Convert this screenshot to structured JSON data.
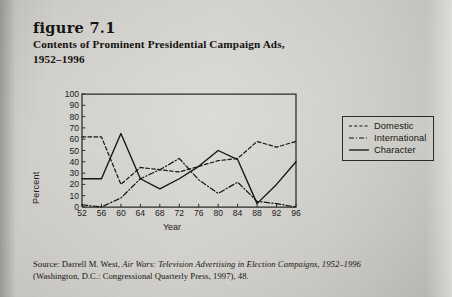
{
  "figure": {
    "number_label": "figure 7.1",
    "title_line1": "Contents of Prominent Presidential Campaign Ads,",
    "title_line2": "1952–1996"
  },
  "legend": {
    "position": "right",
    "items": [
      {
        "label": "Domestic",
        "style": "dashed"
      },
      {
        "label": "International",
        "style": "dash-dot"
      },
      {
        "label": "Character",
        "style": "solid"
      }
    ]
  },
  "source": {
    "line1_prefix": "Source: Darrell M. West, ",
    "line1_italic": "Air Wars: Television Advertising in Election Campaigns, 1952–1996",
    "line2": "(Washington, D.C.: Congressional Quarterly Press, 1997), 48."
  },
  "chart_data": {
    "type": "line",
    "title": "Contents of Prominent Presidential Campaign Ads, 1952–1996",
    "xlabel": "Year",
    "ylabel": "Percent",
    "categories": [
      "52",
      "56",
      "60",
      "64",
      "68",
      "72",
      "76",
      "80",
      "84",
      "88",
      "92",
      "96"
    ],
    "x": [
      52,
      56,
      60,
      64,
      68,
      72,
      76,
      80,
      84,
      88,
      92,
      96
    ],
    "ylim": [
      0,
      100
    ],
    "yticks": [
      0,
      10,
      20,
      30,
      40,
      50,
      60,
      70,
      80,
      90,
      100
    ],
    "grid": false,
    "series": [
      {
        "name": "Domestic",
        "style": "dashed",
        "values": [
          62,
          62,
          20,
          35,
          33,
          31,
          36,
          41,
          43,
          58,
          53,
          58
        ]
      },
      {
        "name": "International",
        "style": "dash-dot",
        "values": [
          2,
          0,
          8,
          25,
          33,
          43,
          24,
          12,
          22,
          5,
          3,
          0
        ]
      },
      {
        "name": "Character",
        "style": "solid",
        "values": [
          25,
          25,
          65,
          25,
          16,
          25,
          36,
          50,
          42,
          3,
          20,
          40
        ]
      }
    ],
    "axis_color": "#2b2a26"
  }
}
